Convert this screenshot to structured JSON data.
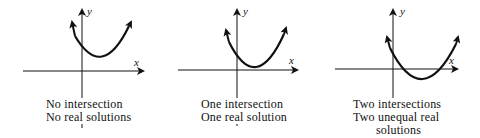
{
  "panels": [
    {
      "id": "no-intersection",
      "axis_labels": {
        "x": "x",
        "y": "y"
      },
      "caption": [
        "No intersection",
        "No real solutions"
      ],
      "curve": {
        "left": [
          72,
          22
        ],
        "vertex": [
          102,
          58
        ],
        "right": [
          131,
          22
        ]
      }
    },
    {
      "id": "one-intersection",
      "axis_labels": {
        "x": "x",
        "y": "y"
      },
      "caption": [
        "One intersection",
        "One real solution"
      ],
      "curve": {
        "left": [
          226,
          30
        ],
        "vertex": [
          256,
          69
        ],
        "right": [
          286,
          28
        ]
      }
    },
    {
      "id": "two-intersections",
      "axis_labels": {
        "x": "x",
        "y": "y"
      },
      "caption": [
        "Two intersections",
        "Two unequal real",
        "solutions"
      ],
      "curve": {
        "left": [
          387,
          37
        ],
        "vertex": [
          422,
          79
        ],
        "right": [
          458,
          37
        ]
      }
    }
  ]
}
